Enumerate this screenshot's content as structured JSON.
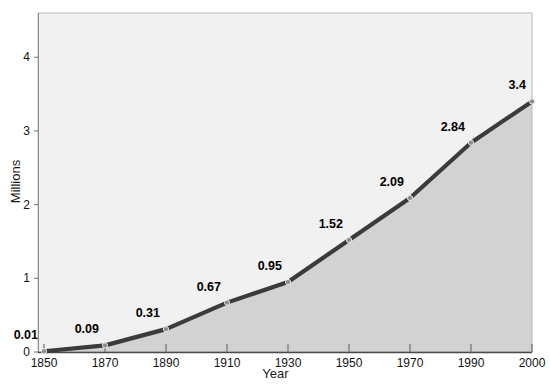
{
  "chart_data": {
    "type": "area",
    "title": "",
    "xlabel": "Year",
    "ylabel": "Millions",
    "categories": [
      "1850",
      "1870",
      "1890",
      "1910",
      "1930",
      "1950",
      "1970",
      "1990",
      "2000"
    ],
    "values": [
      0.01,
      0.09,
      0.31,
      0.67,
      0.95,
      1.52,
      2.09,
      2.84,
      3.4
    ],
    "point_labels": [
      "0.01",
      "0.09",
      "0.31",
      "0.67",
      "0.95",
      "1.52",
      "2.09",
      "2.84",
      "3.4"
    ],
    "yticks": [
      0,
      1,
      2,
      3,
      4
    ],
    "ytick_labels": [
      "0",
      "1",
      "2",
      "3",
      "4"
    ],
    "ylim": [
      0,
      4.6
    ],
    "grid": false,
    "legend": null,
    "series_name": "",
    "colors": {
      "line": "#3b3b3b",
      "area_fill": "#d2d2d2",
      "plot_background": "#f1f1f1",
      "marker_fill": "#8a8a8a",
      "axis": "#9a9a9a",
      "text": "#111111"
    }
  }
}
